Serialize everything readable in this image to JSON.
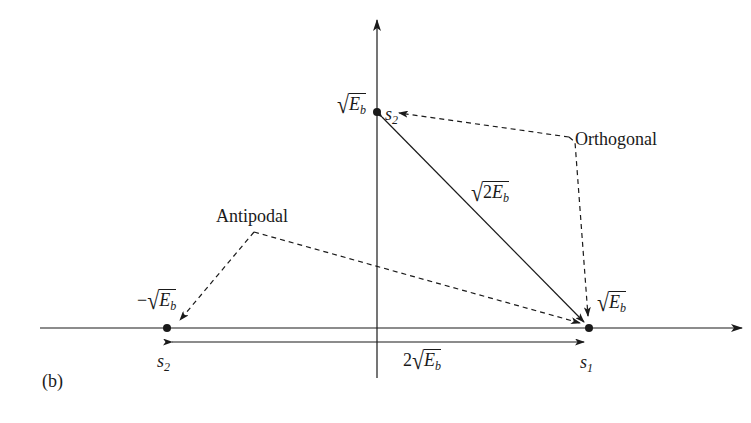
{
  "figure": {
    "panel_label": "(b)",
    "annotations": {
      "orthogonal": "Orthogonal",
      "antipodal": "Antipodal"
    },
    "points": {
      "s2_top": {
        "name": "s",
        "sub": "2",
        "value_prefix": "",
        "value_coef": "",
        "value_var": "E",
        "value_sub": "b"
      },
      "s2_left": {
        "name": "s",
        "sub": "2",
        "value_prefix": "−",
        "value_coef": "",
        "value_var": "E",
        "value_sub": "b"
      },
      "s1": {
        "name": "s",
        "sub": "1",
        "value_prefix": "",
        "value_coef": "",
        "value_var": "E",
        "value_sub": "b"
      }
    },
    "distances": {
      "orthogonal": {
        "coef": "2",
        "var": "E",
        "sub": "b",
        "inside_root": true
      },
      "antipodal": {
        "coef": "2",
        "var": "E",
        "sub": "b",
        "inside_root": false
      }
    }
  },
  "colors": {
    "line": "#1a1a1a",
    "background": "#ffffff"
  }
}
